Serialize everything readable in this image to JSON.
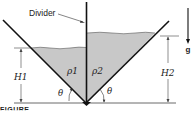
{
  "diagram": {
    "divider_label": "Divider",
    "fluid_left_label": "ρ1",
    "fluid_right_label": "ρ2",
    "height_left_label": "H1",
    "height_right_label": "H2",
    "angle_left_label": "θ",
    "angle_right_label": "θ",
    "gravity_label": "g",
    "caption_fragment": "FIGURE",
    "colors": {
      "fluid_fill": "#c8c8c8",
      "wall": "#111111",
      "dimension_line": "#444444",
      "background": "#ffffff"
    }
  }
}
